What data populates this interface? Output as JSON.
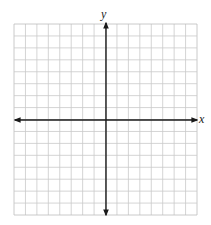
{
  "figure": {
    "type": "coordinate-plane",
    "caption_fragment": "",
    "grid": {
      "columns": 16,
      "rows": 16,
      "left": 14,
      "top": 24,
      "right": 197,
      "bottom": 215,
      "line_color": "#c9c9c9",
      "border_color": "#bdbdbd"
    },
    "axes": {
      "color": "#1a1a1a",
      "x_axis": {
        "label": "x",
        "y_position": 120,
        "arrows": "both"
      },
      "y_axis": {
        "label": "y",
        "x_position": 106,
        "arrows": "both"
      }
    }
  },
  "chart_data": {
    "type": "scatter",
    "title": "",
    "xlabel": "x",
    "ylabel": "y",
    "x": [],
    "y": [],
    "xlim": [
      -8,
      8
    ],
    "ylim": [
      -8,
      8
    ],
    "grid": true,
    "grid_cells": {
      "columns": 16,
      "rows": 16
    },
    "tick_labels": {
      "x": [],
      "y": []
    },
    "legend": null
  }
}
